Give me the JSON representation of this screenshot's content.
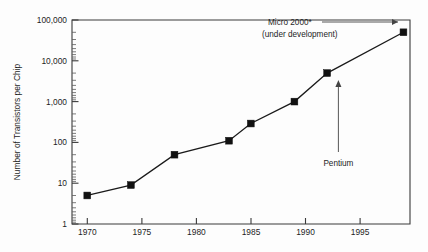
{
  "chart_data": {
    "type": "line",
    "title": "",
    "xlabel": "",
    "ylabel": "Number of Transistors per Chip",
    "xlim": [
      1968.6,
      1999.6
    ],
    "ylim": [
      1,
      100000
    ],
    "yscale": "log",
    "xscale": "linear",
    "grid": false,
    "legend": "none",
    "x_ticks": [
      "1970",
      "1975",
      "1980",
      "1985",
      "1990",
      "1995"
    ],
    "x_tick_values": [
      1970,
      1975,
      1980,
      1985,
      1990,
      1995
    ],
    "y_ticks": [
      "1",
      "10",
      "100",
      "1,000",
      "10,000",
      "100,000"
    ],
    "y_tick_values": [
      1,
      10,
      100,
      1000,
      10000,
      100000
    ],
    "x": [
      1970,
      1974,
      1978,
      1983,
      1985,
      1989,
      1992,
      1999
    ],
    "values": [
      5,
      9,
      50,
      110,
      290,
      1000,
      5000,
      50000
    ],
    "marker": "filled-square",
    "annotations": [
      {
        "name": "micro-2000",
        "line1": "Micro 2000*",
        "line2": "(under development)",
        "points_to_x": 1999,
        "points_to_y": 50000,
        "arrow": "horizontal-right"
      },
      {
        "name": "pentium",
        "line1": "Pentium",
        "points_to_x": 1992,
        "points_to_y": 5000,
        "arrow": "vertical-up"
      }
    ]
  },
  "axis": {
    "y_title": "Number of Transistors per Chip"
  },
  "ticks": {
    "y": {
      "t0": "100,000",
      "t1": "10,000",
      "t2": "1,000",
      "t3": "100",
      "t4": "10",
      "t5": "1"
    },
    "x": {
      "t0": "1970",
      "t1": "1975",
      "t2": "1980",
      "t3": "1985",
      "t4": "1990",
      "t5": "1995"
    }
  },
  "annotations": {
    "micro2000_line1": "Micro 2000*",
    "micro2000_line2": "(under development)",
    "pentium_label": "Pentium"
  },
  "colors": {
    "background": "#fdfdfd",
    "axis": "#3a3a3a",
    "series": "#1a1a1a",
    "marker": "#111111",
    "text": "#1d1d1d"
  }
}
